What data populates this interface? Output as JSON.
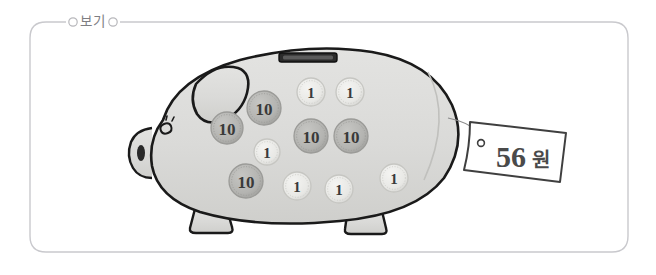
{
  "frame": {
    "label": "보기",
    "border_color": "#c9c9cd",
    "background": "#ffffff",
    "left_marker_icon": "small-circle-icon",
    "right_marker_icon": "small-circle-icon"
  },
  "scene": {
    "title": "piggy-bank-with-coins",
    "piggy_bank": {
      "body_fill": "#dcdcda",
      "outline_color": "#1a1a1a",
      "ear_label": "ear",
      "eye_label": "eye",
      "snout_label": "snout",
      "tail_label": "curly-tail",
      "slot_label": "coin-slot",
      "slot_fill": "#2b2b2b",
      "leg_label": "leg"
    },
    "coins": [
      {
        "value": "10",
        "cx": 227,
        "cy": 128,
        "r": 16,
        "type": "ten"
      },
      {
        "value": "10",
        "cx": 264,
        "cy": 108,
        "r": 17,
        "type": "ten"
      },
      {
        "value": "1",
        "cx": 311,
        "cy": 92,
        "r": 14,
        "type": "one"
      },
      {
        "value": "1",
        "cx": 350,
        "cy": 92,
        "r": 14,
        "type": "one"
      },
      {
        "value": "1",
        "cx": 267,
        "cy": 152,
        "r": 13,
        "type": "one"
      },
      {
        "value": "10",
        "cx": 311,
        "cy": 136,
        "r": 17,
        "type": "ten"
      },
      {
        "value": "10",
        "cx": 351,
        "cy": 136,
        "r": 17,
        "type": "ten"
      },
      {
        "value": "10",
        "cx": 246,
        "cy": 181,
        "r": 17,
        "type": "ten"
      },
      {
        "value": "1",
        "cx": 297,
        "cy": 186,
        "r": 14,
        "type": "one"
      },
      {
        "value": "1",
        "cx": 339,
        "cy": 189,
        "r": 14,
        "type": "one"
      },
      {
        "value": "1",
        "cx": 394,
        "cy": 178,
        "r": 14,
        "type": "one"
      }
    ],
    "coin_colors": {
      "ten_fill": "#b9b9b6",
      "ten_rim": "#9b9b98",
      "one_fill": "#ededea",
      "one_rim": "#c6c6c2"
    },
    "price_tag": {
      "amount": "56",
      "currency": "원",
      "fill": "#ffffff",
      "outline_color": "#4a4a4a",
      "hole_icon": "tag-hole-icon",
      "string_label": "tag-string"
    },
    "totals": {
      "ten_coin_count": 5,
      "one_coin_count": 6,
      "total_value": "56"
    }
  }
}
